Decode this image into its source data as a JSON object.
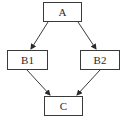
{
  "diagram": {
    "type": "flowchart",
    "nodes": [
      {
        "id": "A",
        "label": "A",
        "x": 43,
        "y": 2,
        "w": 39,
        "h": 20
      },
      {
        "id": "B1",
        "label": "B1",
        "x": 7,
        "y": 50,
        "w": 41,
        "h": 20
      },
      {
        "id": "B2",
        "label": "B2",
        "x": 80,
        "y": 50,
        "w": 40,
        "h": 20
      },
      {
        "id": "C",
        "label": "C",
        "x": 44,
        "y": 96,
        "w": 39,
        "h": 20
      }
    ],
    "edges": [
      {
        "from": "A",
        "to": "B1"
      },
      {
        "from": "A",
        "to": "B2"
      },
      {
        "from": "B1",
        "to": "C"
      },
      {
        "from": "B2",
        "to": "C"
      }
    ],
    "colors": {
      "stroke": "#3a3a3a",
      "background": "#ffffff",
      "text": "#2a2a2a"
    }
  }
}
